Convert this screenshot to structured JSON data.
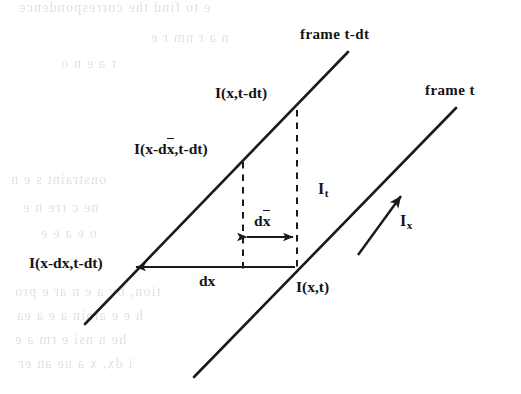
{
  "figure": {
    "stroke_color": "#1a1a1a",
    "background_color": "#ffffff",
    "ghost_text_color": "#c9c9cb"
  },
  "labels": {
    "frame_prev": "frame t-dt",
    "frame_curr": "frame t",
    "intensity_x_tdt": "I(x,t-dt)",
    "intensity_xdxbar_tdt_prefix": "I(x-d",
    "intensity_xdxbar_tdt_bar": "x",
    "intensity_xdxbar_tdt_suffix": ",t-dt)",
    "intensity_xdx_tdt": "I(x-dx,t-dt)",
    "intensity_x_t": "I(x,t)",
    "dx_outer": "dx",
    "dx_inner_prefix": "d",
    "dx_inner_bar": "x",
    "it_base": "I",
    "it_sub": "t",
    "ix_base": "I",
    "ix_sub": "x"
  },
  "geometry": {
    "line_prev_frame": {
      "x1": 85,
      "y1": 324,
      "x2": 348,
      "y2": 52
    },
    "line_curr_frame": {
      "x1": 194,
      "y1": 377,
      "x2": 456,
      "y2": 108
    },
    "dashed_left": {
      "x": 243,
      "y1": 162,
      "y2": 268
    },
    "dashed_right": {
      "x": 297,
      "y1": 110,
      "y2": 268
    },
    "arrow_dx_outer": {
      "x1": 297,
      "y1": 267,
      "x2": 131,
      "y2": 267
    },
    "arrow_dx_inner": {
      "x1": 243,
      "y1": 237,
      "x2": 297,
      "y2": 237
    },
    "arrow_ix": {
      "x1": 360,
      "y1": 253,
      "x2": 404,
      "y2": 192
    }
  },
  "ghost_text": [
    {
      "text": "e to find the correspondence",
      "x": 18,
      "y": 6
    },
    {
      "text": "n a r  nm   r  e",
      "x": 150,
      "y": 36
    },
    {
      "text": "r  a e n o",
      "x": 60,
      "y": 62
    },
    {
      "text": "onstraint s  e n",
      "x": 10,
      "y": 178
    },
    {
      "text": "ne c  rre  n  e",
      "x": 22,
      "y": 206
    },
    {
      "text": "o e a e e",
      "x": 40,
      "y": 232
    },
    {
      "text": "tion, by a  e  n  ar  e pro",
      "x": 14,
      "y": 290
    },
    {
      "text": "h  e  e ainin  a  e  a  ea",
      "x": 16,
      "y": 314
    },
    {
      "text": "he  n  nsi  e   rm   a  e",
      "x": 14,
      "y": 338
    },
    {
      "text": "i   dx,  x  a ue  an  er",
      "x": 18,
      "y": 362
    }
  ]
}
